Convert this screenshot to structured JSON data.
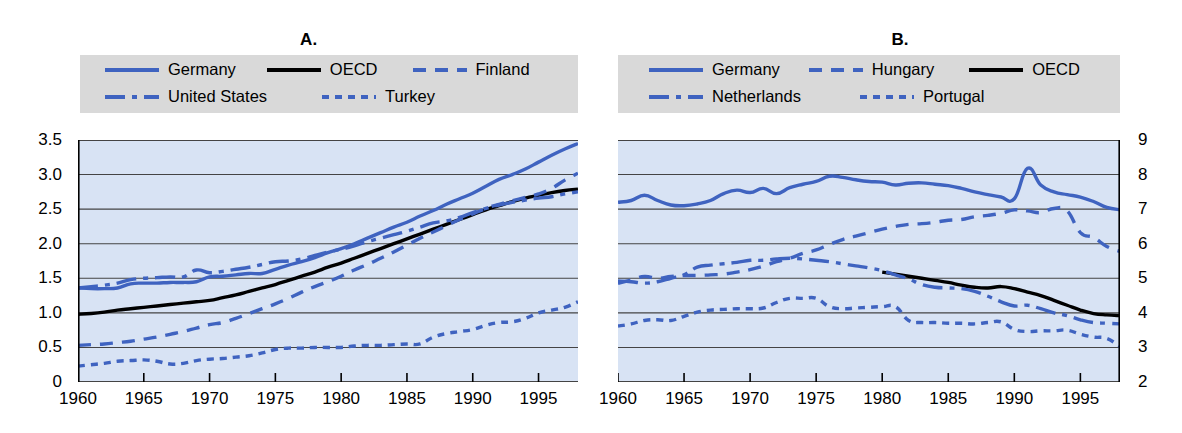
{
  "figure": {
    "background": "#ffffff",
    "plot_background": "#d8e3f4",
    "series_color_blue": "#3f63c0",
    "series_color_black": "#000000",
    "legend_background": "#d9d9d9",
    "gridline_color": "#444444"
  },
  "panels": [
    {
      "id": "A",
      "title_label": "A.",
      "title_text": "Practising physicians",
      "legend_rows": [
        [
          {
            "label": "Germany",
            "style": "solid",
            "color": "#3f63c0"
          },
          {
            "label": "OECD",
            "style": "solid",
            "color": "#000000"
          },
          {
            "label": "Finland",
            "style": "dashed",
            "color": "#3f63c0"
          }
        ],
        [
          {
            "label": "United States",
            "style": "dashdot",
            "color": "#3f63c0"
          },
          {
            "label": "Turkey",
            "style": "dotted",
            "color": "#3f63c0"
          }
        ]
      ],
      "ylabels_side": "left",
      "yticks": [
        "3.5",
        "3.0",
        "2.5",
        "2.0",
        "1.5",
        "1.0",
        "0.5",
        "0"
      ],
      "xticks": [
        "1960",
        "1965",
        "1970",
        "1975",
        "1980",
        "1985",
        "1990",
        "1995"
      ]
    },
    {
      "id": "B",
      "title_label": "B.",
      "title_text": "Acute care beds",
      "legend_rows": [
        [
          {
            "label": "Germany",
            "style": "solid",
            "color": "#3f63c0"
          },
          {
            "label": "Hungary",
            "style": "dashed",
            "color": "#3f63c0"
          },
          {
            "label": "OECD",
            "style": "solid",
            "color": "#000000"
          }
        ],
        [
          {
            "label": "Netherlands",
            "style": "dashdot",
            "color": "#3f63c0"
          },
          {
            "label": "Portugal",
            "style": "dotted",
            "color": "#3f63c0"
          }
        ]
      ],
      "ylabels_side": "right",
      "yticks": [
        "9",
        "8",
        "7",
        "6",
        "5",
        "4",
        "3",
        "2"
      ],
      "xticks": [
        "1960",
        "1965",
        "1970",
        "1975",
        "1980",
        "1985",
        "1990",
        "1995"
      ]
    }
  ],
  "chart_data": [
    {
      "type": "line",
      "title": "A.  Practising physicians",
      "xlabel": "",
      "ylabel": "",
      "xlim": [
        1960,
        1998
      ],
      "ylim": [
        0,
        3.5
      ],
      "yticks": [
        0,
        0.5,
        1.0,
        1.5,
        2.0,
        2.5,
        3.0,
        3.5
      ],
      "xticks": [
        1960,
        1965,
        1970,
        1975,
        1980,
        1985,
        1990,
        1995
      ],
      "grid": true,
      "legend_position": "top",
      "x": [
        1960,
        1961,
        1962,
        1963,
        1964,
        1965,
        1966,
        1967,
        1968,
        1969,
        1970,
        1971,
        1972,
        1973,
        1974,
        1975,
        1976,
        1977,
        1978,
        1979,
        1980,
        1981,
        1982,
        1983,
        1984,
        1985,
        1986,
        1987,
        1988,
        1989,
        1990,
        1991,
        1992,
        1993,
        1994,
        1995,
        1996,
        1997,
        1998
      ],
      "series": [
        {
          "name": "Germany",
          "style": "solid",
          "color": "#3f63c0",
          "values": [
            1.36,
            1.35,
            1.35,
            1.36,
            1.42,
            1.43,
            1.43,
            1.44,
            1.44,
            1.45,
            1.52,
            1.53,
            1.55,
            1.57,
            1.57,
            1.63,
            1.69,
            1.74,
            1.8,
            1.87,
            1.93,
            2.0,
            2.08,
            2.16,
            2.24,
            2.31,
            2.4,
            2.48,
            2.57,
            2.65,
            2.73,
            2.83,
            2.93,
            3.0,
            3.08,
            3.18,
            3.28,
            3.37,
            3.45
          ]
        },
        {
          "name": "OECD",
          "style": "solid",
          "color": "#000000",
          "values": [
            0.98,
            0.99,
            1.01,
            1.04,
            1.06,
            1.08,
            1.1,
            1.12,
            1.14,
            1.16,
            1.18,
            1.22,
            1.26,
            1.31,
            1.36,
            1.41,
            1.47,
            1.53,
            1.59,
            1.66,
            1.72,
            1.79,
            1.86,
            1.93,
            2.0,
            2.07,
            2.14,
            2.21,
            2.28,
            2.35,
            2.42,
            2.49,
            2.55,
            2.61,
            2.66,
            2.7,
            2.74,
            2.77,
            2.79
          ]
        },
        {
          "name": "Finland",
          "style": "dashed",
          "color": "#3f63c0",
          "values": [
            0.53,
            0.54,
            0.55,
            0.57,
            0.59,
            0.62,
            0.65,
            0.69,
            0.73,
            0.78,
            0.83,
            0.86,
            0.92,
            0.99,
            1.06,
            1.13,
            1.21,
            1.3,
            1.38,
            1.45,
            1.53,
            1.62,
            1.7,
            1.79,
            1.88,
            1.98,
            2.08,
            2.17,
            2.26,
            2.35,
            2.43,
            2.51,
            2.57,
            2.62,
            2.67,
            2.72,
            2.8,
            2.92,
            3.02
          ]
        },
        {
          "name": "United States",
          "style": "dashdot",
          "color": "#3f63c0",
          "values": [
            1.36,
            1.38,
            1.4,
            1.43,
            1.48,
            1.5,
            1.51,
            1.52,
            1.52,
            1.62,
            1.58,
            1.6,
            1.63,
            1.66,
            1.7,
            1.74,
            1.75,
            1.78,
            1.83,
            1.88,
            1.92,
            1.97,
            2.03,
            2.08,
            2.13,
            2.18,
            2.24,
            2.3,
            2.33,
            2.38,
            2.45,
            2.51,
            2.56,
            2.6,
            2.63,
            2.66,
            2.68,
            2.72,
            2.75
          ]
        },
        {
          "name": "Turkey",
          "style": "dotted",
          "color": "#3f63c0",
          "values": [
            0.23,
            0.25,
            0.27,
            0.3,
            0.31,
            0.32,
            0.3,
            0.26,
            0.27,
            0.31,
            0.33,
            0.34,
            0.36,
            0.38,
            0.42,
            0.47,
            0.49,
            0.49,
            0.5,
            0.5,
            0.5,
            0.52,
            0.53,
            0.53,
            0.54,
            0.55,
            0.55,
            0.65,
            0.7,
            0.73,
            0.76,
            0.82,
            0.86,
            0.87,
            0.92,
            1.0,
            1.04,
            1.08,
            1.16
          ]
        }
      ]
    },
    {
      "type": "line",
      "title": "B.  Acute care beds",
      "xlabel": "",
      "ylabel": "",
      "xlim": [
        1960,
        1998
      ],
      "ylim": [
        2,
        9
      ],
      "yticks": [
        2,
        3,
        4,
        5,
        6,
        7,
        8,
        9
      ],
      "xticks": [
        1960,
        1965,
        1970,
        1975,
        1980,
        1985,
        1990,
        1995
      ],
      "grid": true,
      "legend_position": "top",
      "x": [
        1960,
        1961,
        1962,
        1963,
        1964,
        1965,
        1966,
        1967,
        1968,
        1969,
        1970,
        1971,
        1972,
        1973,
        1974,
        1975,
        1976,
        1977,
        1978,
        1979,
        1980,
        1981,
        1982,
        1983,
        1984,
        1985,
        1986,
        1987,
        1988,
        1989,
        1990,
        1991,
        1992,
        1993,
        1994,
        1995,
        1996,
        1997,
        1998
      ],
      "series": [
        {
          "name": "Germany",
          "style": "solid",
          "color": "#3f63c0",
          "values": [
            7.2,
            7.25,
            7.4,
            7.25,
            7.12,
            7.1,
            7.15,
            7.25,
            7.45,
            7.55,
            7.48,
            7.6,
            7.45,
            7.62,
            7.72,
            7.8,
            7.95,
            7.92,
            7.85,
            7.8,
            7.78,
            7.7,
            7.75,
            7.76,
            7.72,
            7.68,
            7.6,
            7.5,
            7.42,
            7.35,
            7.3,
            8.18,
            7.7,
            7.5,
            7.42,
            7.35,
            7.22,
            7.05,
            6.98
          ]
        },
        {
          "name": "Hungary",
          "style": "dashed",
          "color": "#3f63c0",
          "values": [
            4.85,
            4.95,
            5.05,
            5.0,
            5.05,
            5.08,
            5.08,
            5.1,
            5.12,
            5.18,
            5.25,
            5.35,
            5.48,
            5.58,
            5.72,
            5.82,
            5.98,
            6.12,
            6.22,
            6.32,
            6.42,
            6.5,
            6.56,
            6.58,
            6.62,
            6.68,
            6.7,
            6.78,
            6.82,
            6.88,
            6.98,
            6.95,
            6.9,
            7.02,
            6.95,
            6.32,
            6.18,
            5.92,
            5.78
          ]
        },
        {
          "name": "OECD",
          "style": "solid",
          "color": "#000000",
          "values": [
            null,
            null,
            null,
            null,
            null,
            null,
            null,
            null,
            null,
            null,
            null,
            null,
            null,
            null,
            null,
            null,
            null,
            null,
            null,
            null,
            5.18,
            5.12,
            5.06,
            5.0,
            4.94,
            4.88,
            4.8,
            4.74,
            4.72,
            4.76,
            4.7,
            4.6,
            4.5,
            4.36,
            4.22,
            4.08,
            3.98,
            3.94,
            3.92
          ]
        },
        {
          "name": "Netherlands",
          "style": "dashdot",
          "color": "#3f63c0",
          "values": [
            4.92,
            4.9,
            4.86,
            4.9,
            5.0,
            5.1,
            5.32,
            5.38,
            5.42,
            5.46,
            5.52,
            5.52,
            5.56,
            5.58,
            5.56,
            5.52,
            5.48,
            5.42,
            5.36,
            5.3,
            5.22,
            5.1,
            4.98,
            4.82,
            4.74,
            4.72,
            4.7,
            4.62,
            4.48,
            4.32,
            4.2,
            4.22,
            4.12,
            4.0,
            3.92,
            3.8,
            3.72,
            3.7,
            3.68
          ]
        },
        {
          "name": "Portugal",
          "style": "dotted",
          "color": "#3f63c0",
          "values": [
            3.62,
            3.68,
            3.78,
            3.8,
            3.78,
            3.9,
            4.02,
            4.08,
            4.1,
            4.12,
            4.12,
            4.14,
            4.3,
            4.42,
            4.42,
            4.42,
            4.18,
            4.12,
            4.14,
            4.16,
            4.18,
            4.18,
            3.78,
            3.72,
            3.72,
            3.7,
            3.7,
            3.68,
            3.72,
            3.74,
            3.52,
            3.46,
            3.48,
            3.48,
            3.5,
            3.38,
            3.3,
            3.26,
            3.02
          ]
        }
      ]
    }
  ]
}
